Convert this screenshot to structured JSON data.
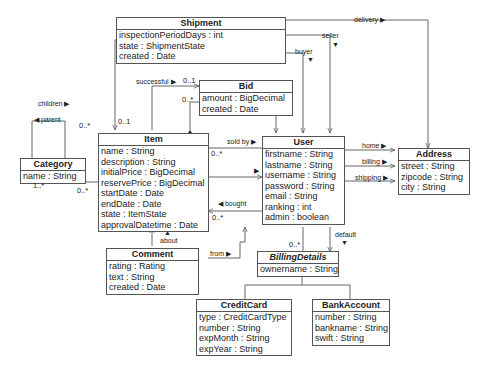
{
  "classes": {
    "shipment": {
      "name": "Shipment",
      "attrs": [
        "inspectionPeriodDays : int",
        "state : ShipmentState",
        "created : Date"
      ]
    },
    "bid": {
      "name": "Bid",
      "attrs": [
        "amount : BigDecimal",
        "created : Date"
      ]
    },
    "category": {
      "name": "Category",
      "attrs": [
        "name : String"
      ]
    },
    "item": {
      "name": "Item",
      "attrs": [
        "name : String",
        "description : String",
        "initialPrice : BigDecimal",
        "reservePrice : BigDecimal",
        "startDate : Date",
        "endDate : Date",
        "state : ItemState",
        "approvalDatetime : Date"
      ]
    },
    "user": {
      "name": "User",
      "attrs": [
        "firstname : String",
        "lastname : String",
        "username : String",
        "password : String",
        "email : String",
        "ranking : int",
        "admin : boolean"
      ]
    },
    "address": {
      "name": "Address",
      "attrs": [
        "street : String",
        "zipcode : String",
        "city : String"
      ]
    },
    "comment": {
      "name": "Comment",
      "attrs": [
        "rating : Rating",
        "text : String",
        "created : Date"
      ]
    },
    "billing": {
      "name": "BillingDetails",
      "attrs": [
        "ownername : String"
      ]
    },
    "creditcard": {
      "name": "CreditCard",
      "attrs": [
        "type : CreditCardType",
        "number : String",
        "expMonth : String",
        "expYear : String"
      ]
    },
    "bankaccount": {
      "name": "BankAccount",
      "attrs": [
        "number : String",
        "bankname : String",
        "swift : String"
      ]
    }
  },
  "labels": {
    "delivery": "delivery ▶",
    "seller": "seller",
    "buyer": "buyer",
    "successful": "successful ▶",
    "children": "children ▶",
    "parent": "◀ parent",
    "sold_by": "sold by ▶",
    "bought": "◀ bought",
    "home": "home ▶",
    "billing": "billing ▶",
    "shipping": "shipping ▶",
    "default": "default",
    "about": "about",
    "from": "from ▶"
  },
  "multiplicities": {
    "successful_one": "0..1",
    "bid_many": "0..*",
    "shipment_item": "0..1",
    "children_many": "0..*",
    "category_one_many": "1..*",
    "category_item_many": "0..*",
    "sold_by_many": "0..*",
    "bought_many": "0..*",
    "billing_many": "0..*"
  }
}
